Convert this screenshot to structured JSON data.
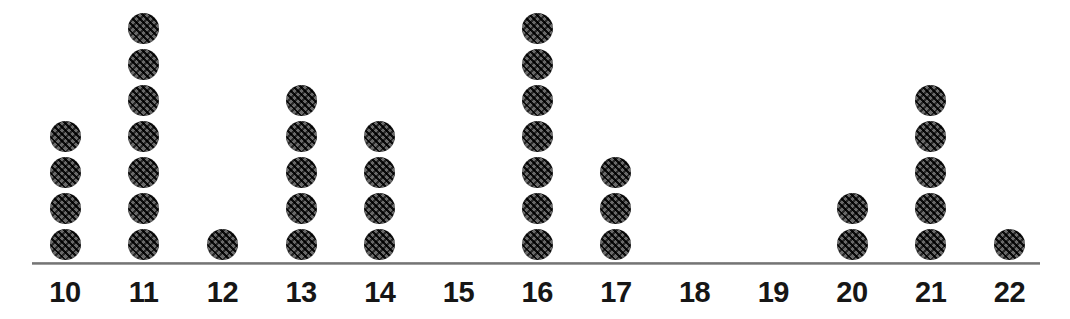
{
  "chart_data": {
    "type": "dot-plot",
    "title": "",
    "subtitle": "",
    "xlabel": "",
    "ylabel": "",
    "categories": [
      "10",
      "11",
      "12",
      "13",
      "14",
      "15",
      "16",
      "17",
      "18",
      "19",
      "20",
      "21",
      "22"
    ],
    "values": [
      4,
      7,
      1,
      5,
      4,
      0,
      7,
      3,
      0,
      0,
      2,
      5,
      1
    ],
    "xlim": [
      10,
      22
    ],
    "ylim": [
      0,
      7
    ],
    "total_dots": 39,
    "dot_unit": 1,
    "grid": false,
    "legend": null,
    "annotations": [],
    "points": [
      {
        "category": "10",
        "count": 4
      },
      {
        "category": "11",
        "count": 7
      },
      {
        "category": "12",
        "count": 1
      },
      {
        "category": "13",
        "count": 5
      },
      {
        "category": "14",
        "count": 4
      },
      {
        "category": "15",
        "count": 0
      },
      {
        "category": "16",
        "count": 7
      },
      {
        "category": "17",
        "count": 3
      },
      {
        "category": "18",
        "count": 0
      },
      {
        "category": "19",
        "count": 0
      },
      {
        "category": "20",
        "count": 2
      },
      {
        "category": "21",
        "count": 5
      },
      {
        "category": "22",
        "count": 1
      }
    ]
  },
  "style": {
    "dot_color": "#3a3a3a",
    "axis_color": "#6e6e6e",
    "label_color": "#161616",
    "background": "#ffffff"
  },
  "layout": {
    "axis_left_px": 32,
    "axis_right_px": 1040,
    "first_tick_center_px": 65,
    "tick_spacing_px": 78.7,
    "axis_y_px": 262
  }
}
